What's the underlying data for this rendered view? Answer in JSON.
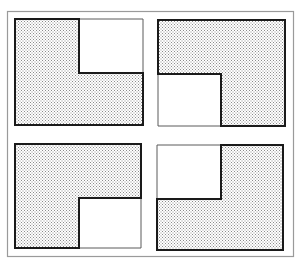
{
  "figure": {
    "colors": {
      "background": "#ffffff",
      "frame_stroke": "#9a9a9a",
      "panel_stroke": "#1a1a1a",
      "shade_dot": "#8c8c8c"
    },
    "panels": [
      {
        "id": "top-left",
        "notch_corner": "top-right"
      },
      {
        "id": "top-right",
        "notch_corner": "bottom-left"
      },
      {
        "id": "bottom-left",
        "notch_corner": "bottom-right"
      },
      {
        "id": "bottom-right",
        "notch_corner": "top-left"
      }
    ]
  }
}
